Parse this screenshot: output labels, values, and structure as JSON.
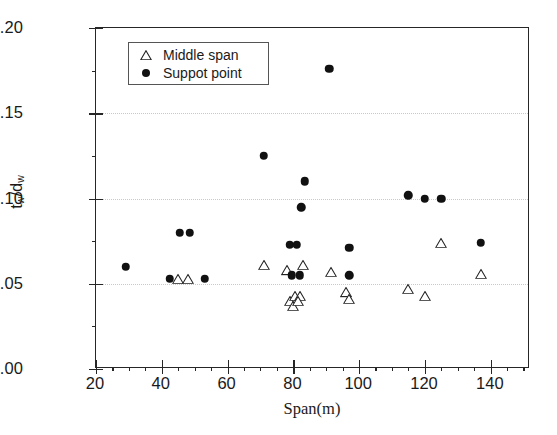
{
  "chart_data": {
    "type": "scatter",
    "title": "",
    "xlabel": "Span(m)",
    "ylabel": "t_w/d_w",
    "ylabel_parts": {
      "num_base": "t",
      "num_sub": "w",
      "slash": "/",
      "den_base": "d",
      "den_sub": "w"
    },
    "xlim": [
      20,
      152
    ],
    "ylim": [
      0.0,
      0.2
    ],
    "xticks": [
      20,
      40,
      60,
      80,
      100,
      120,
      140
    ],
    "xtick_labels": [
      "20",
      "40",
      "60",
      "80",
      "100",
      "120",
      "140"
    ],
    "yticks": [
      0.0,
      0.05,
      0.1,
      0.15,
      0.2
    ],
    "ytick_labels": [
      "0.00",
      "0.05",
      "0.10",
      "0.15",
      "0.20"
    ],
    "x_minor_interval": 5,
    "y_minor_interval": 0.025,
    "grid": {
      "x": false,
      "y": true,
      "style": "dotted",
      "color": "#c9c9c9",
      "at": [
        0.05,
        0.1,
        0.15
      ]
    },
    "legend": {
      "position": "top-left-inside",
      "border": true,
      "entries": [
        {
          "label": "Middle span",
          "marker": "triangle-open",
          "color": "#222222"
        },
        {
          "label": "Suppot point",
          "marker": "circle-filled",
          "color": "#111111"
        }
      ]
    },
    "series": [
      {
        "name": "Middle span",
        "marker": "triangle-open",
        "color": "#222222",
        "points": [
          [
            45.0,
            0.053
          ],
          [
            48.0,
            0.053
          ],
          [
            71.0,
            0.061
          ],
          [
            78.0,
            0.058
          ],
          [
            79.0,
            0.04
          ],
          [
            80.0,
            0.037
          ],
          [
            80.5,
            0.043
          ],
          [
            82.0,
            0.043
          ],
          [
            81.5,
            0.04
          ],
          [
            83.0,
            0.061
          ],
          [
            91.5,
            0.057
          ],
          [
            96.0,
            0.045
          ],
          [
            97.0,
            0.041
          ],
          [
            115.0,
            0.047
          ],
          [
            120.0,
            0.043
          ],
          [
            125.0,
            0.074
          ],
          [
            137.0,
            0.056
          ]
        ]
      },
      {
        "name": "Suppot point",
        "marker": "circle-filled",
        "color": "#111111",
        "points": [
          [
            29.0,
            0.06
          ],
          [
            42.5,
            0.053
          ],
          [
            53.0,
            0.053
          ],
          [
            45.5,
            0.08
          ],
          [
            48.5,
            0.08
          ],
          [
            71.0,
            0.125
          ],
          [
            79.0,
            0.073
          ],
          [
            81.0,
            0.073
          ],
          [
            79.5,
            0.055
          ],
          [
            82.0,
            0.055
          ],
          [
            82.5,
            0.095
          ],
          [
            83.5,
            0.11
          ],
          [
            91.0,
            0.176
          ],
          [
            97.0,
            0.071
          ],
          [
            97.0,
            0.055
          ],
          [
            115.0,
            0.102
          ],
          [
            120.0,
            0.1
          ],
          [
            125.0,
            0.1
          ],
          [
            137.0,
            0.074
          ]
        ]
      }
    ]
  }
}
